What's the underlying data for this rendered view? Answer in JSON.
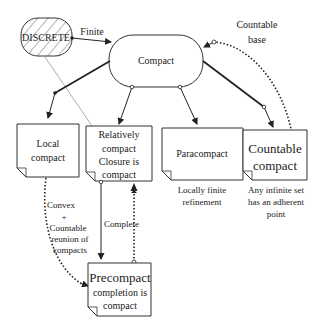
{
  "nodes": {
    "discrete": {
      "label": "DISCRETE"
    },
    "compact": {
      "label": "Compact"
    },
    "local": {
      "lines": [
        "Local",
        "compact"
      ]
    },
    "relative": {
      "lines": [
        "Relatively",
        "compact",
        "Closure is",
        "compact"
      ]
    },
    "para": {
      "label": "Paracompact",
      "note": [
        "Locally finite",
        "refinement"
      ]
    },
    "countable": {
      "lines": [
        "Countable",
        "compact"
      ],
      "note": [
        "Any infinite set",
        "has an adherent",
        "point"
      ]
    },
    "precompact": {
      "lines": [
        "Precompact",
        "completion is",
        "compact"
      ]
    }
  },
  "edges": {
    "finite": "Finite",
    "countable_base": [
      "Countable",
      "base"
    ],
    "complete": "Complete",
    "convex": [
      "Convex",
      "+",
      "Countable",
      "reunion of",
      "compacts"
    ]
  }
}
